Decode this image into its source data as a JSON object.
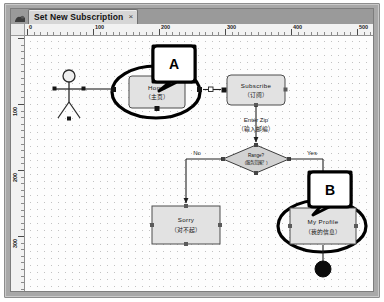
{
  "window": {
    "app_icon": "app-icon"
  },
  "tab": {
    "title": "Set New Subscription",
    "close_label": "×"
  },
  "rulers": {
    "horizontal_labels": [
      "0",
      "100",
      "200",
      "300",
      "400",
      "500"
    ],
    "vertical_labels": [
      "100",
      "200",
      "300",
      "400"
    ],
    "unit_spacing_px": 6.6
  },
  "canvas": {
    "background": "#fdfdfd",
    "grid": "dotted",
    "grid_color": "#c2c2c2"
  },
  "diagram": {
    "type": "activity-flowchart",
    "actor": {
      "name": "actor-stick-figure",
      "label": ""
    },
    "nodes": [
      {
        "id": "home",
        "label": "Home",
        "label_cn": "（主页）",
        "shape": "rounded-rect",
        "fill": "#e2e2e2",
        "stroke": "#4a4a4a",
        "highlighted": true
      },
      {
        "id": "subscribe",
        "label": "Subscribe",
        "label_cn": "（订阅）",
        "shape": "rounded-rect",
        "fill": "#e2e2e2",
        "stroke": "#4a4a4a",
        "highlighted": false
      },
      {
        "id": "sorry",
        "label": "Sorry",
        "label_cn": "（对不起）",
        "shape": "rect",
        "fill": "#e2e2e2",
        "stroke": "#4a4a4a",
        "highlighted": false
      },
      {
        "id": "my-profile",
        "label": "My Profile",
        "label_cn": "（我的信息）",
        "shape": "rect",
        "fill": "#e2e2e2",
        "stroke": "#4a4a4a",
        "highlighted": true
      },
      {
        "id": "range-decision",
        "label": "Range?",
        "label_cn": "（服务范围？）",
        "shape": "diamond",
        "fill": "#d4d4d4",
        "stroke": "#3c3c3c",
        "highlighted": false
      },
      {
        "id": "end-node",
        "label": "",
        "shape": "filled-circle",
        "fill": "#0a0a0a",
        "stroke": "#0a0a0a",
        "highlighted": false
      }
    ],
    "edge_labels": {
      "enter_zip": "Enter Zip",
      "enter_zip_cn": "（输入邮编）",
      "no": "No",
      "yes": "Yes"
    },
    "callouts": [
      {
        "id": "callout-a",
        "letter": "A",
        "target": "home"
      },
      {
        "id": "callout-b",
        "letter": "B",
        "target": "my-profile"
      }
    ]
  }
}
